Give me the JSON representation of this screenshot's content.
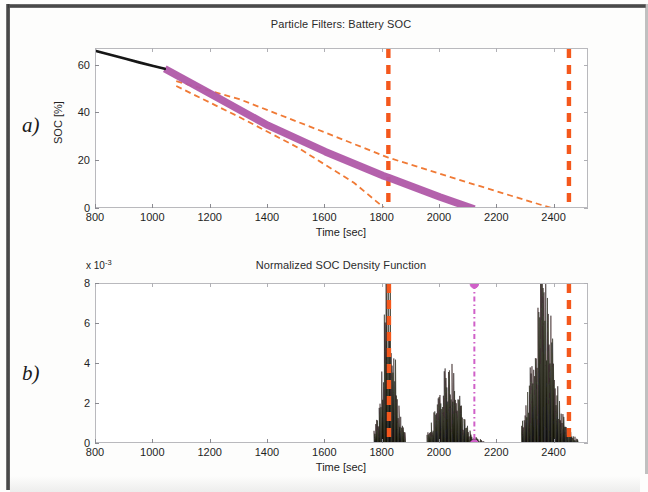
{
  "figure": {
    "panels": [
      {
        "letter": "a)",
        "title": "Particle Filters: Battery SOC",
        "xlabel": "Time [sec]",
        "ylabel": "SOC [%]"
      },
      {
        "letter": "b)",
        "title": "Normalized SOC Density Function",
        "xlabel": "Time [sec]",
        "ylabel": "",
        "exponent_prefix": "x 10",
        "exponent_power": "-3"
      }
    ]
  },
  "colors": {
    "measured_line": "#151515",
    "prediction_band": "#b05aa8",
    "confidence_bound": "#f07a36",
    "event_line": "#f4581f",
    "marker_line": "#d060c8",
    "histogram": "#140d0a",
    "axis": "#6f6f74",
    "text": "#1f1f1f"
  },
  "chart_data": [
    {
      "type": "line",
      "panel": "a",
      "title": "Particle Filters: Battery SOC",
      "xlabel": "Time [sec]",
      "ylabel": "SOC [%]",
      "xlim": [
        800,
        2520
      ],
      "ylim": [
        0,
        67
      ],
      "xticks": [
        800,
        1000,
        1200,
        1400,
        1600,
        1800,
        2000,
        2200,
        2400
      ],
      "yticks": [
        0,
        20,
        40,
        60
      ],
      "grid": false,
      "legend_position": "none",
      "series": [
        {
          "name": "Measured SOC",
          "style": "solid",
          "color": "#151515",
          "width": 2.6,
          "x": [
            800,
            850,
            900,
            950,
            1000,
            1040
          ],
          "y": [
            66.2,
            64.6,
            63.0,
            61.4,
            59.9,
            58.7
          ]
        },
        {
          "name": "Particle filter SOC prediction (median)",
          "style": "solid-thick",
          "color": "#b05aa8",
          "width": 7.5,
          "x": [
            1040,
            1200,
            1400,
            1600,
            1800,
            1820,
            2000,
            2120
          ],
          "y": [
            58.7,
            48.2,
            35.0,
            24.0,
            14.0,
            13.2,
            5.0,
            0.0
          ]
        },
        {
          "name": "Upper confidence bound",
          "style": "dashed",
          "color": "#f07a36",
          "width": 1.8,
          "x": [
            1080,
            1300,
            1600,
            1820,
            2100,
            2400
          ],
          "y": [
            53.5,
            46.0,
            32.0,
            21.5,
            11.0,
            0.0
          ]
        },
        {
          "name": "Lower confidence bound",
          "style": "dashed",
          "color": "#f07a36",
          "width": 1.8,
          "x": [
            1080,
            1300,
            1500,
            1700,
            1810
          ],
          "y": [
            51.5,
            38.5,
            26.0,
            11.0,
            0.0
          ]
        }
      ],
      "vertical_lines": [
        {
          "name": "end-of-discharge-early",
          "x": 1820,
          "color": "#f4581f",
          "style": "dashed"
        },
        {
          "name": "end-of-discharge-late",
          "x": 2450,
          "color": "#f4581f",
          "style": "dashed"
        }
      ]
    },
    {
      "type": "area",
      "panel": "b",
      "title": "Normalized SOC Density Function",
      "xlabel": "Time [sec]",
      "ylabel": "",
      "y_scale_exponent": -3,
      "xlim": [
        800,
        2520
      ],
      "ylim": [
        0,
        8
      ],
      "xticks": [
        800,
        1000,
        1200,
        1400,
        1600,
        1800,
        2000,
        2200,
        2400
      ],
      "yticks": [
        0,
        2,
        4,
        6,
        8
      ],
      "grid": false,
      "legend_position": "none",
      "modes": [
        {
          "name": "mode-1",
          "center": 1822,
          "peak": 8.0,
          "span": [
            1770,
            1880
          ],
          "clipped": true
        },
        {
          "name": "mode-2",
          "center": 2030,
          "peak": 3.6,
          "span": [
            1955,
            2165
          ],
          "clipped": false
        },
        {
          "name": "mode-3",
          "center": 2360,
          "peak": 7.8,
          "span": [
            2285,
            2480
          ],
          "clipped": false
        }
      ],
      "vertical_lines": [
        {
          "name": "end-of-discharge-early",
          "x": 1822,
          "color": "#f4581f",
          "style": "dashed"
        },
        {
          "name": "end-of-discharge-late",
          "x": 2450,
          "color": "#f4581f",
          "style": "dashed"
        },
        {
          "name": "predicted-eod-marker",
          "x": 2120,
          "color": "#d060c8",
          "style": "dash-dot",
          "markers": [
            0,
            8
          ]
        }
      ]
    }
  ]
}
